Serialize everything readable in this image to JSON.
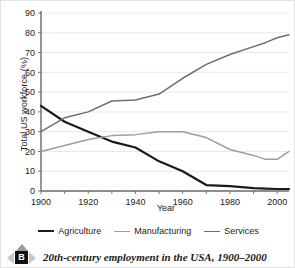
{
  "chart_data": {
    "type": "line",
    "title": "",
    "xlabel": "Year",
    "ylabel": "Total US workforce (%)",
    "xlim": [
      1900,
      2005
    ],
    "ylim": [
      0,
      90
    ],
    "xticks": [
      1900,
      1920,
      1940,
      1960,
      1980,
      2000
    ],
    "yticks": [
      0,
      10,
      20,
      30,
      40,
      50,
      60,
      70,
      80,
      90
    ],
    "grid": "horizontal",
    "legend_position": "below",
    "x": [
      1900,
      1910,
      1920,
      1930,
      1940,
      1950,
      1960,
      1970,
      1980,
      1990,
      1995,
      2000,
      2005
    ],
    "series": [
      {
        "name": "Agriculture",
        "color": "#1a1a1a",
        "values": [
          43,
          35,
          30,
          25,
          22,
          15,
          10,
          3,
          2.5,
          1.5,
          1.2,
          1,
          1
        ]
      },
      {
        "name": "Manufacturing",
        "color": "#9e9e9e",
        "values": [
          20,
          23,
          26,
          28,
          28.5,
          30,
          30,
          27,
          21,
          18,
          16,
          16,
          20
        ]
      },
      {
        "name": "Services",
        "color": "#6e6e6e",
        "values": [
          30,
          37,
          40,
          45.5,
          46,
          49,
          57,
          64,
          69,
          73,
          75,
          77.5,
          79
        ]
      }
    ]
  },
  "legend": {
    "entries": [
      {
        "label": "Agriculture",
        "color": "#1a1a1a",
        "width": "2.2px"
      },
      {
        "label": "Manufacturing",
        "color": "#9e9e9e",
        "width": "1.6px"
      },
      {
        "label": "Services",
        "color": "#6e6e6e",
        "width": "1.6px"
      }
    ]
  },
  "caption": {
    "badge_letter": "B",
    "text": "20th-century employment in the USA, 1900–2000"
  }
}
